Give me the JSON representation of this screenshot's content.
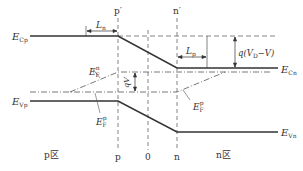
{
  "diagram": {
    "type": "pn-junction-energy-band-diagram",
    "labels": {
      "ecp": "E",
      "ecp_sub": "Cp",
      "ecn": "E",
      "ecn_sub": "Cn",
      "evp": "E",
      "evp_sub": "Vp",
      "evn": "E",
      "evn_sub": "Vn",
      "efn": "E",
      "efn_sub": "F",
      "efn_sup": "n",
      "efp": "E",
      "efp_sub": "F",
      "efp_sup": "p",
      "ln": "L",
      "ln_sub": "n",
      "lp": "L",
      "lp_sub": "p",
      "barrier": "q(V",
      "barrier_sub": "D",
      "barrier_tail": "−V)",
      "qv": "qV",
      "p_prime": "p′",
      "n_prime": "n′",
      "p": "p",
      "zero": "0",
      "n": "n",
      "p_region": "p区",
      "n_region": "n区"
    },
    "colors": {
      "line": "#333333",
      "dash": "#666666"
    }
  }
}
